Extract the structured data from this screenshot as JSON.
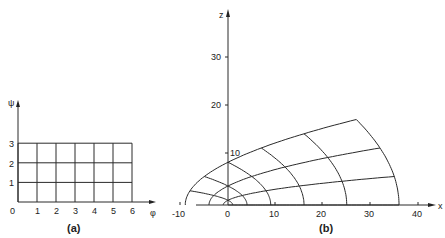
{
  "figure_a": {
    "caption": "(a)",
    "x_axis_label": "φ",
    "y_axis_label": "ψ",
    "origin_label": "0",
    "x_ticks": [
      "1",
      "2",
      "3",
      "4",
      "5",
      "6"
    ],
    "y_ticks": [
      "1",
      "2",
      "3"
    ],
    "grid": {
      "phi_range": [
        0,
        6
      ],
      "psi_range": [
        0,
        3
      ],
      "step": 1
    }
  },
  "figure_b": {
    "caption": "(b)",
    "x_axis_label": "x",
    "z_axis_label": "z",
    "x_ticks": [
      "-10",
      "0",
      "10",
      "20",
      "30",
      "40"
    ],
    "z_ticks": [
      "10",
      "20",
      "30"
    ],
    "description": "Conformal image of the rectangular (φ, ψ) grid: curvilinear parabolic-type mesh in the x–z plane"
  }
}
